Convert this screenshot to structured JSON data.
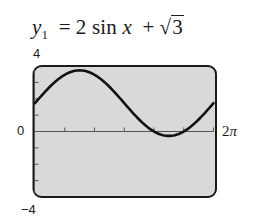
{
  "title": {
    "lhs_var": "y",
    "lhs_sub": "1",
    "equals": "=",
    "coef": "2",
    "func": "sin",
    "arg": "x",
    "plus": "+",
    "sqrt_symbol": "√",
    "sqrt_radicand": "3"
  },
  "labels": {
    "ymax": "4",
    "ymin": "−4",
    "xmin": "0",
    "xmax_coef": "2",
    "xmax_pi": "π"
  },
  "colors": {
    "screen_fill": "#d9d9d9",
    "frame": "#1a1a1a",
    "curve": "#111111",
    "axis": "#555555"
  },
  "chart_data": {
    "type": "line",
    "xlabel": "",
    "ylabel": "",
    "xlim": [
      0,
      6.2832
    ],
    "ylim": [
      -4,
      4
    ],
    "x_tick_labels": [
      "0",
      "2π"
    ],
    "y_tick_labels": [
      "-4",
      "4"
    ],
    "x_tick_step": "π/3",
    "y_tick_step": 1,
    "grid": false,
    "legend": null,
    "series": [
      {
        "name": "y1 = 2 sin x + √3",
        "x": [
          0,
          0.5236,
          1.0472,
          1.5708,
          2.0944,
          2.618,
          3.1416,
          3.6652,
          4.1888,
          4.7124,
          5.236,
          5.7596,
          6.2832
        ],
        "values": [
          1.732,
          2.732,
          3.464,
          3.732,
          3.464,
          2.732,
          1.732,
          0.732,
          0.0,
          -0.268,
          0.0,
          0.732,
          1.732
        ]
      }
    ]
  }
}
